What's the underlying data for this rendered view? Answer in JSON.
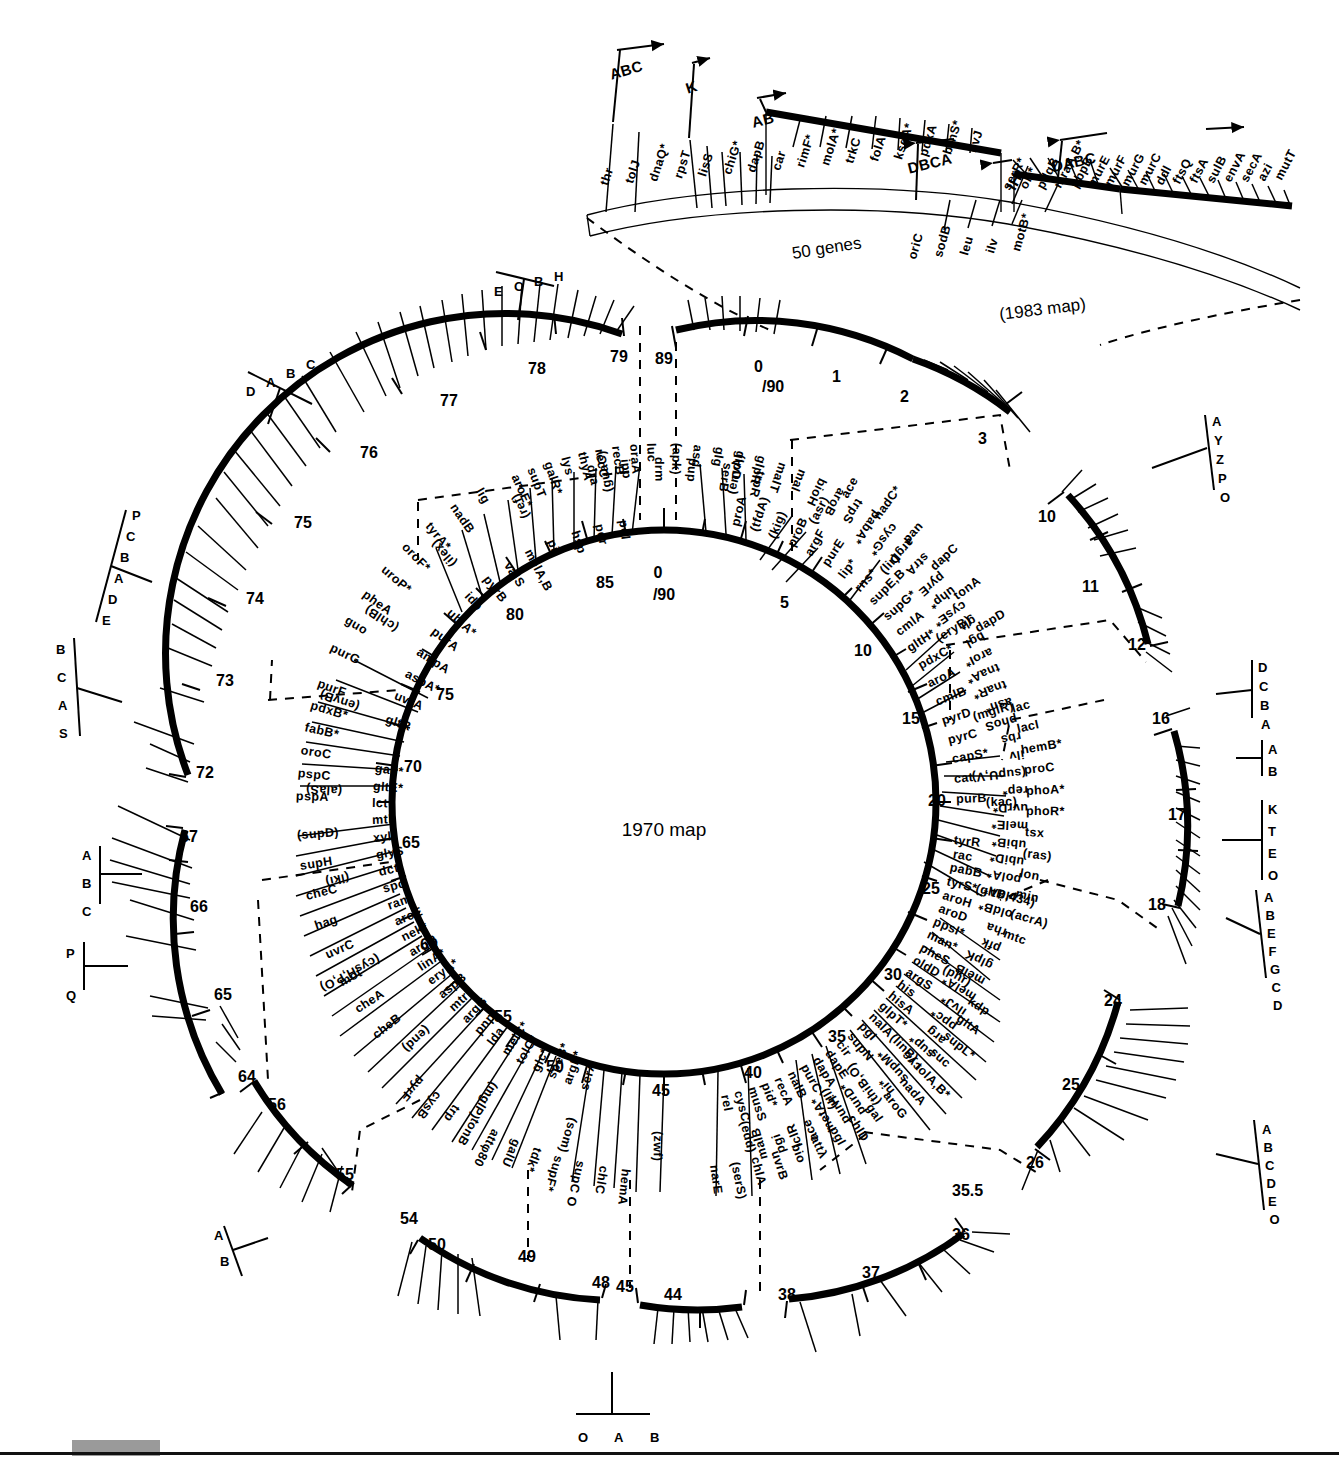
{
  "figure": {
    "center_label": "1970 map",
    "inset_scale_label": "50 genes",
    "inset_title": "(1983 map)",
    "ink_color": "#000000",
    "background_color": "#ffffff",
    "footer_swatch_color": "#9a9a9a"
  },
  "inset_1983": {
    "bracket_labels": [
      "ABC",
      "K",
      "AB",
      "DABC",
      "DBCA",
      "IH"
    ],
    "upper_genes": [
      "thr",
      "tolJ",
      "dnaQ*",
      "rpsT",
      "lisS",
      "chiG*",
      "dapB",
      "car",
      "rimF*",
      "molA*",
      "trkC",
      "folA",
      "ksgA*",
      "pdxA",
      "brnS*",
      "ilvJ"
    ],
    "lower_genes": [
      "oriC",
      "sodB",
      "leu",
      "ilv",
      "motB*"
    ],
    "right_genes": [
      "serR*",
      "ori*",
      "pdqB",
      "mraA,B*",
      "pbpB",
      "murE",
      "murF",
      "murG",
      "murC",
      "ddl",
      "ftsQ",
      "ftsA",
      "sulB",
      "envA",
      "secA",
      "azi",
      "mutT"
    ]
  },
  "outer_ring": {
    "tick_numbers": [
      "89",
      "0/90",
      "1",
      "2",
      "3",
      "10",
      "11",
      "12",
      "16",
      "17",
      "18",
      "24",
      "25",
      "26",
      "35.5",
      "36",
      "37",
      "38",
      "44",
      "45",
      "48",
      "49",
      "50",
      "54",
      "55",
      "56",
      "64",
      "65",
      "66",
      "67",
      "72",
      "73",
      "74",
      "75",
      "76",
      "77",
      "78",
      "79"
    ],
    "segments": [
      {
        "name": "seg-0-1",
        "genes": [
          "dra",
          "ipp",
          "drm",
          "pup",
          "serB",
          "trpR"
        ]
      },
      {
        "name": "seg-1-3",
        "genes": [
          "ace",
          "nadC*",
          "pan",
          "dapC",
          "tonA",
          "dapD"
        ]
      },
      {
        "name": "seg-10-12",
        "genes": [
          "lac",
          "lacI",
          "hemB*",
          "proC",
          "phoA*",
          "phoR*",
          "tsx",
          "(ras)",
          "lon",
          "min",
          "(acrA)",
          "mtc"
        ],
        "brackets": [
          {
            "for": "lac",
            "letters": [
              "A",
              "Y",
              "Z",
              "P",
              "O"
            ]
          }
        ]
      },
      {
        "name": "seg-16-18",
        "genes": [
          "kdp",
          "gltA",
          "supL*",
          "suc",
          "tolA,B*",
          "nadA",
          "aroG",
          "gal",
          "chlD",
          "pgl",
          "attλ",
          "bio",
          "uvrB",
          "chlA",
          "(serS)",
          "narE"
        ],
        "brackets": [
          {
            "for": "kdp",
            "letters": [
              "D",
              "C",
              "B",
              "A"
            ]
          },
          {
            "for": "suc",
            "letters": [
              "A",
              "B"
            ]
          },
          {
            "for": "gal",
            "letters": [
              "K",
              "T",
              "E",
              "O"
            ]
          },
          {
            "for": "bio",
            "letters": [
              "A",
              "B",
              "E",
              "F",
              "G",
              "C",
              "D"
            ]
          }
        ]
      },
      {
        "name": "seg-24-26",
        "genes": [
          "hemA",
          "chlC",
          "supC O",
          "supF*",
          "tdk*",
          "galU",
          "attφ80",
          "tonB",
          "trp",
          "cysB",
          "pyrF"
        ],
        "brackets": [
          {
            "for": "trp",
            "letters": [
              "A",
              "B",
              "C",
              "D",
              "E",
              "O"
            ]
          }
        ]
      },
      {
        "name": "seg-35.5-38",
        "genes": [
          "cheB",
          "cheA",
          "mot",
          "uvrC",
          "hag",
          "cheC",
          "supH",
          "(supD)"
        ]
      },
      {
        "name": "seg-44-45",
        "genes": [
          "pspA",
          "pspC",
          "oroC",
          "fabB*",
          "pdxB*",
          "purF"
        ]
      },
      {
        "name": "seg-48-50",
        "genes": [
          "purG",
          "guo",
          "pheA",
          "uroP*",
          "oroF*",
          "tyrA*",
          "nadB",
          "lig"
        ],
        "brackets": [
          {
            "for": "guo",
            "letters": [
              "O",
              "A",
              "B"
            ]
          }
        ]
      },
      {
        "name": "seg-54-56",
        "genes": [
          "aroE*",
          "supT",
          "galR*",
          "lys",
          "thyA",
          "recC",
          "recB",
          "oraA",
          "luc"
        ],
        "brackets": [
          {
            "for": "lys",
            "letters": [
              "A",
              "B"
            ]
          }
        ]
      },
      {
        "name": "seg-64-67",
        "genes": [
          "(apk)",
          "asd",
          "glg",
          "glpD",
          "glpR",
          "malT",
          "mal",
          "bioH",
          "aroB",
          "trpS",
          "pabA*",
          "cysG*",
          "argD",
          "strA"
        ],
        "brackets": [
          {
            "for": "glg",
            "letters": [
              "A",
              "B",
              "C"
            ]
          },
          {
            "for": "mal",
            "letters": [
              "P",
              "Q"
            ]
          }
        ]
      },
      {
        "name": "seg-72-79",
        "genes": [
          "pyrE",
          "uhp*",
          "cysE*",
          "glt",
          "bgl",
          "aroI*",
          "tnaA*",
          "tnaR*",
          "asn*",
          "phoS",
          "rbs",
          "ilv",
          "(supU,V)",
          "rep*",
          "uvrD*",
          "melE*",
          "ubiB*",
          "ubiD*",
          "polA*",
          "oldA*",
          "oldB*",
          "rha",
          "pfk",
          "glpK",
          "melB",
          "melA*",
          "ilvJ*",
          "ppc*",
          "arg",
          "sup*",
          "cyc",
          "supM*",
          "hi*",
          "(thiB,O)",
          "purD*",
          "purH",
          "metA*",
          "ace",
          "iclR",
          "pgi",
          "malB"
        ],
        "brackets": [
          {
            "for": "glt",
            "letters": [
              "B",
              "C",
              "A",
              "S"
            ]
          },
          {
            "for": "ilv",
            "letters": [
              "P",
              "C",
              "B",
              "A",
              "D",
              "E"
            ]
          },
          {
            "for": "rha",
            "letters": [
              "D",
              "A",
              "B",
              "C"
            ]
          },
          {
            "for": "metA",
            "letters": [
              "E",
              "C",
              "B",
              "H"
            ]
          }
        ]
      }
    ]
  },
  "inner_ring": {
    "tick_numbers": [
      "0/90",
      "5",
      "10",
      "15",
      "20",
      "25",
      "30",
      "35",
      "40",
      "45",
      "50",
      "55",
      "60",
      "65",
      "70",
      "75",
      "80",
      "85"
    ],
    "dashed_labels": [
      "(envA)",
      "(asr)",
      "(lir)",
      "(eryB)",
      "(mglR)",
      "(kac)",
      "(gltB,434)",
      "(phr)",
      "(linB)",
      "(lir)",
      "(edd)",
      "(zwf)",
      "(som)",
      "(mglP)",
      "(end)",
      "(cysH,P,O)",
      "(iki)",
      "(alaS)",
      "(envB)",
      "(chlB)",
      "(ilex)",
      "(ref)",
      "(guaC)"
    ],
    "genes_0_25": [
      "proA",
      "(tfdA)",
      "(kig)",
      "proB",
      "argF",
      "purE",
      "lip*",
      "rns*",
      "supE,B",
      "supG*",
      "cmlA",
      "gltH*",
      "pdxC*",
      "aroA",
      "cmlB",
      "pyrD",
      "pyrC",
      "capS*",
      "cat",
      "purB"
    ],
    "genes_25_45": [
      "tyrR",
      "rac",
      "pabB",
      "tyrS*",
      "aroH",
      "aroD",
      "ppsI*",
      "man*",
      "pheS",
      "oldD",
      "argS",
      "his",
      "hisA",
      "glpT*",
      "nalA",
      "pgI",
      "supN",
      "cir",
      "dapE",
      "dapA",
      "purC",
      "nalB",
      "recA",
      "pid*",
      "musS",
      "cysC",
      "rel"
    ],
    "genes_45_70": [
      "serA",
      "argP*",
      "speB*",
      "glc*",
      "tolC*",
      "melC*",
      "lda",
      "pnp",
      "argG",
      "mtr*",
      "aspB",
      "eryA*",
      "linA*",
      "argR",
      "nek*",
      "aroE",
      "ram",
      "spc",
      "dct",
      "glyS",
      "xyl",
      "mtl",
      "lct",
      "gltE*",
      "gad*"
    ],
    "genes_70_90": [
      "gltR",
      "uvrA",
      "aspA*",
      "ampA",
      "purA",
      "ubiA*",
      "idp",
      "pyrB",
      "valS",
      "melA,B",
      "pil",
      "hsp",
      "pdr",
      "pol"
    ]
  }
}
